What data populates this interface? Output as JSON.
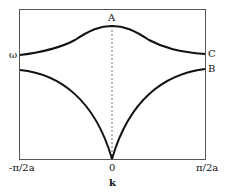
{
  "diagram": {
    "y_axis_label": "ω",
    "x_axis_label": "k",
    "x_ticks": [
      "-π/2a",
      "0",
      "π/2a"
    ],
    "points": {
      "A": "A",
      "B": "B",
      "C": "C"
    },
    "branches": [
      {
        "name": "optical",
        "description": "upper curve, maximum at k=0 (A), falls to C at zone boundary"
      },
      {
        "name": "acoustic",
        "description": "lower curve, zero at k=0, rises to B at zone boundary"
      }
    ],
    "colors": {
      "line": "#111111",
      "frame": "#555555",
      "background": "#ffffff"
    }
  }
}
